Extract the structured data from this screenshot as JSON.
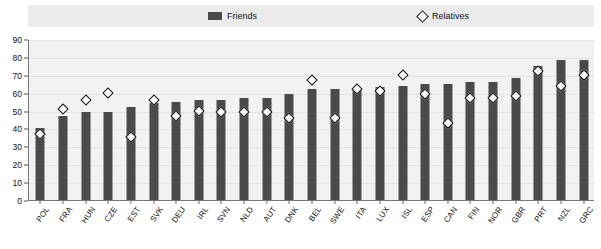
{
  "legend": {
    "friends_label": "Friends",
    "relatives_label": "Relatives",
    "friends_color": "#4a4a4a",
    "relatives_marker": "diamond-open"
  },
  "axes": {
    "y_ticks": [
      0,
      10,
      20,
      30,
      40,
      50,
      60,
      70,
      80,
      90
    ],
    "y_min": 0,
    "y_max": 90
  },
  "chart_data": {
    "type": "bar",
    "title": "",
    "subtitle": "",
    "xlabel": "",
    "ylabel": "",
    "ylim": [
      0,
      90
    ],
    "grid": true,
    "legend_position": "top",
    "categories": [
      "POL",
      "FRA",
      "HUN",
      "CZE",
      "EST",
      "SVK",
      "DEU",
      "IRL",
      "SVN",
      "NLD",
      "AUT",
      "DNK",
      "BEL",
      "SWE",
      "ITA",
      "LUX",
      "ISL",
      "ESP",
      "CAN",
      "FIN",
      "NOR",
      "GBR",
      "PRT",
      "NZL",
      "GRC"
    ],
    "series": [
      {
        "name": "Friends",
        "type": "bar",
        "values": [
          40,
          47,
          49,
          49,
          52,
          54,
          55,
          56,
          56,
          57,
          57,
          59,
          62,
          62,
          62,
          63,
          64,
          65,
          65,
          66,
          66,
          68,
          75,
          78,
          78
        ]
      },
      {
        "name": "Relatives",
        "type": "scatter",
        "values": [
          37,
          51,
          56,
          60,
          35,
          56,
          47,
          50,
          49,
          49,
          49,
          46,
          67,
          46,
          62,
          61,
          70,
          59,
          43,
          57,
          57,
          58,
          72,
          64,
          70
        ]
      }
    ]
  }
}
